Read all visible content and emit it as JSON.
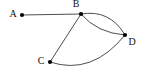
{
  "figure": {
    "kind": "undirected-graph-diagram",
    "background_color": "#ffffff",
    "edge_color": "#3a3a3a",
    "node_color": "#000000",
    "label_color": "#111111",
    "width": 141,
    "height": 77
  },
  "chart_data": {
    "type": "diagram",
    "title": "",
    "nodes": [
      {
        "id": "A",
        "label": "A",
        "x": 22,
        "y": 15,
        "label_x": 13,
        "label_y": 15,
        "radius": 2.1
      },
      {
        "id": "B",
        "label": "B",
        "x": 81,
        "y": 14,
        "label_x": 76,
        "label_y": 5,
        "radius": 2.1
      },
      {
        "id": "C",
        "label": "C",
        "x": 50,
        "y": 62,
        "label_x": 41,
        "label_y": 62,
        "radius": 2.1
      },
      {
        "id": "D",
        "label": "D",
        "x": 125,
        "y": 35,
        "label_x": 132,
        "label_y": 43,
        "radius": 2.1
      }
    ],
    "edges": [
      {
        "id": "A-B",
        "from": "A",
        "to": "B",
        "shape": "straight",
        "path": "M 22 15 L 81 14"
      },
      {
        "id": "B-C",
        "from": "B",
        "to": "C",
        "shape": "straight",
        "path": "M 81 14 L 50 62"
      },
      {
        "id": "B-D-upper",
        "from": "B",
        "to": "D",
        "shape": "curve-up",
        "path": "M 81 14 Q 110 9 125 35"
      },
      {
        "id": "B-D-lower",
        "from": "B",
        "to": "D",
        "shape": "curve-down",
        "path": "M 81 14 Q 97 33 125 35"
      },
      {
        "id": "C-D",
        "from": "C",
        "to": "D",
        "shape": "curve-down",
        "path": "M 50 62 Q 92 76 125 35"
      }
    ],
    "node_count": 4,
    "edge_count": 5,
    "multi_edges": [
      "B-D"
    ]
  }
}
